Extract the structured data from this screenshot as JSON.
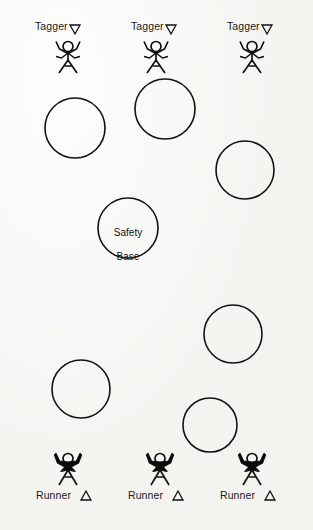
{
  "diagram": {
    "background_color": "#f7f7f5",
    "stroke_color": "#111111",
    "fill_color": "#000000",
    "width": 313,
    "height": 530,
    "taggers": [
      {
        "label": "Tagger",
        "marker": "triangle-down-outline-icon",
        "label_x": 35,
        "label_y": 22,
        "marker_x": 70,
        "marker_y": 25,
        "figure_x": 54,
        "figure_y": 40
      },
      {
        "label": "Tagger",
        "marker": "triangle-down-outline-icon",
        "label_x": 131,
        "label_y": 22,
        "marker_x": 166,
        "marker_y": 25,
        "figure_x": 142,
        "figure_y": 40
      },
      {
        "label": "Tagger",
        "marker": "triangle-down-outline-icon",
        "label_x": 227,
        "label_y": 22,
        "marker_x": 262,
        "marker_y": 25,
        "figure_x": 238,
        "figure_y": 40
      }
    ],
    "runners": [
      {
        "label": "Runner",
        "marker": "triangle-up-outline-icon",
        "label_x": 38,
        "label_y": 491,
        "marker_x": 81,
        "marker_y": 491,
        "figure_x": 54,
        "figure_y": 452
      },
      {
        "label": "Runner",
        "marker": "triangle-up-outline-icon",
        "label_x": 130,
        "label_y": 491,
        "marker_x": 173,
        "marker_y": 491,
        "figure_x": 146,
        "figure_y": 452
      },
      {
        "label": "Runner",
        "marker": "triangle-up-outline-icon",
        "label_x": 222,
        "label_y": 491,
        "marker_x": 265,
        "marker_y": 491,
        "figure_x": 238,
        "figure_y": 452
      }
    ],
    "safety_base": {
      "label": "Safety\nBase",
      "line1": "Safety",
      "line2": "Base",
      "cx": 128,
      "cy": 228,
      "r": 30
    },
    "obstacle_circles": [
      {
        "cx": 75,
        "cy": 128,
        "r": 30
      },
      {
        "cx": 165,
        "cy": 109,
        "r": 30
      },
      {
        "cx": 245,
        "cy": 170,
        "r": 29
      },
      {
        "cx": 233,
        "cy": 334,
        "r": 29
      },
      {
        "cx": 81,
        "cy": 389,
        "r": 29
      },
      {
        "cx": 210,
        "cy": 425,
        "r": 27
      }
    ]
  }
}
